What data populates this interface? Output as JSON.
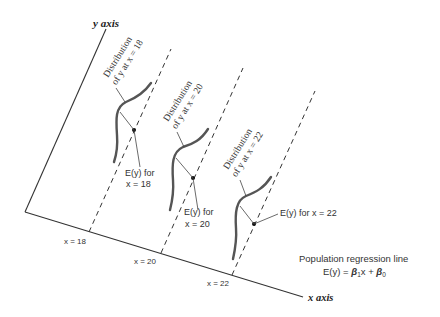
{
  "axes": {
    "y_label": "y axis",
    "x_label": "x axis"
  },
  "x_ticks": [
    {
      "label": "x = 18"
    },
    {
      "label": "x = 20"
    },
    {
      "label": "x = 22"
    }
  ],
  "distributions": [
    {
      "line1": "Distribution",
      "line2": "of y at x = 18",
      "ey_line1": "E(y) for",
      "ey_line2": "x = 18"
    },
    {
      "line1": "Distribution",
      "line2": "of y at x = 20",
      "ey_line1": "E(y) for",
      "ey_line2": "x = 20"
    },
    {
      "line1": "Distribution",
      "line2": "of y at x = 22",
      "ey_single": "E(y) for x = 22"
    }
  ],
  "regression": {
    "title": "Population regression line",
    "equation_lhs": "E(y) = ",
    "beta1": "β",
    "beta1_sub": "1",
    "x_term": "x + ",
    "beta0": "β",
    "beta0_sub": "0"
  },
  "colors": {
    "line": "#333333",
    "curve": "#555555",
    "text": "#333333"
  }
}
